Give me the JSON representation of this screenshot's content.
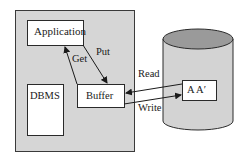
{
  "diagram": {
    "type": "buffer-management",
    "colors": {
      "container_fill": "#d6d6d6",
      "container_border": "#3a3a3a",
      "box_fill": "#ffffff",
      "box_border": "#2a2a2a",
      "cylinder_body": "#d3d3d3",
      "cylinder_top": "#9a9a9a",
      "line": "#1a1a1a"
    },
    "nodes": {
      "application": {
        "label": "Application"
      },
      "dbms": {
        "label": "DBMS"
      },
      "buffer": {
        "label": "Buffer"
      },
      "disk_block": {
        "label": "A A′"
      }
    },
    "edges": {
      "get": {
        "label": "Get",
        "from": "buffer",
        "to": "application"
      },
      "put": {
        "label": "Put",
        "from": "application",
        "to": "buffer"
      },
      "read": {
        "label": "Read",
        "from": "disk_block",
        "to": "buffer"
      },
      "write": {
        "label": "Write",
        "from": "buffer",
        "to": "disk_block"
      }
    }
  }
}
